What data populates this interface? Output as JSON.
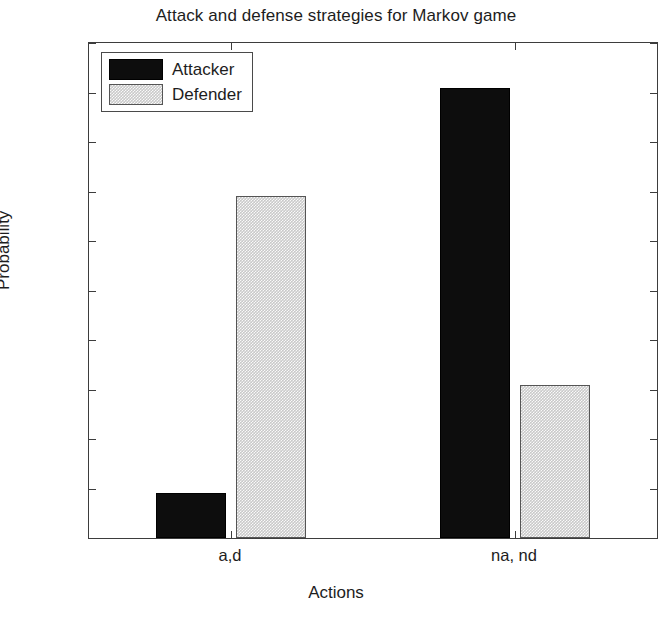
{
  "chart_data": {
    "type": "bar",
    "title": "Attack and defense strategies for Markov game",
    "xlabel": "Actions",
    "ylabel": "Probability",
    "categories": [
      "a,d",
      "na, nd"
    ],
    "series": [
      {
        "name": "Attacker",
        "color": "#0d0d0d",
        "values": [
          0.09,
          0.91
        ]
      },
      {
        "name": "Defender",
        "color": "#c9c9c9",
        "values": [
          0.69,
          0.31
        ]
      }
    ],
    "ylim": [
      0,
      1
    ],
    "yticks": [
      0,
      0.1,
      0.2,
      0.3,
      0.4,
      0.5,
      0.6,
      0.7,
      0.8,
      0.9,
      1
    ],
    "ytick_labels": [
      "0",
      "0.1",
      "0.2",
      "0.3",
      "0.4",
      "0.5",
      "0.6",
      "0.7",
      "0.8",
      "0.9",
      "1"
    ],
    "grid": false,
    "legend_position": "top-left-inside",
    "legend_entries": [
      "Attacker",
      "Defender"
    ]
  }
}
